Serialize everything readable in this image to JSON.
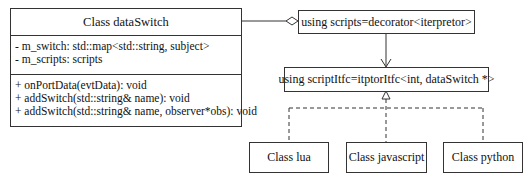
{
  "main_class": {
    "title": "Class dataSwitch",
    "attributes": [
      "- m_switch: std::map<std::string, subject>",
      "- m_scripts: scripts"
    ],
    "methods": [
      "+ onPortData(evtData): void",
      "+ addSwitch(std::string& name): void",
      "+ addSwitch(std::string& name, observer*obs): void"
    ]
  },
  "scripts_box": {
    "label": "using scripts=decorator<iterpretor>"
  },
  "itfc_box": {
    "label": "using scriptItfc=itptorItfc<int, dataSwitch *>"
  },
  "subclasses": [
    {
      "label": "Class lua"
    },
    {
      "label": "Class javascript"
    },
    {
      "label": "Class python"
    }
  ],
  "relations": [
    {
      "from": "Class dataSwitch",
      "to": "using scripts=decorator<iterpretor>",
      "type": "aggregation"
    },
    {
      "from": "using scripts=decorator<iterpretor>",
      "to": "using scriptItfc=itptorItfc<int, dataSwitch *>",
      "type": "dependency"
    },
    {
      "from": "Class lua",
      "to": "using scriptItfc=itptorItfc<int, dataSwitch *>",
      "type": "realization"
    },
    {
      "from": "Class javascript",
      "to": "using scriptItfc=itptorItfc<int, dataSwitch *>",
      "type": "realization"
    },
    {
      "from": "Class python",
      "to": "using scriptItfc=itptorItfc<int, dataSwitch *>",
      "type": "realization"
    }
  ]
}
